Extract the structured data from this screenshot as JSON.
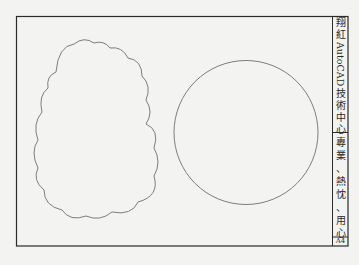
{
  "title_block": {
    "center_name": {
      "chars": [
        "翔",
        "紅"
      ],
      "latin": "AutoCAD",
      "chars_after": [
        "技",
        "術",
        "中",
        "心"
      ]
    },
    "motto": {
      "chars": [
        "專",
        "業",
        "、",
        "熱",
        "忱",
        "、",
        "用",
        "心"
      ]
    },
    "sheet_size": "A4"
  },
  "drawing": {
    "shapes": [
      {
        "type": "revision-cloud",
        "label": "cloud"
      },
      {
        "type": "circle",
        "cx": 246,
        "cy": 132,
        "r": 72
      }
    ],
    "colors": {
      "border": "#2b2b2b",
      "shape_stroke": "#7d7d7d",
      "background": "#f3f3f1"
    }
  }
}
